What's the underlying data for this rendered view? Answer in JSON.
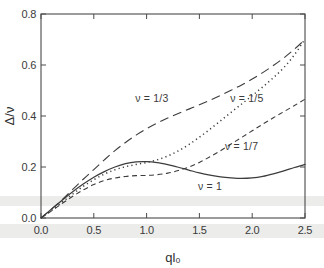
{
  "figure": {
    "background_color": "#ffffff",
    "ink_color": "#3c3c3c"
  },
  "axes": {
    "x_title": "ql₀",
    "y_title": "Δ/ν",
    "x_ticks": [
      "0.0",
      "0.5",
      "1.0",
      "1.5",
      "2.0",
      "2.5"
    ],
    "y_ticks": [
      "0.0",
      "0.2",
      "0.4",
      "0.6",
      "0.8"
    ]
  },
  "labels": {
    "nu_one_third": "ν = 1/3",
    "nu_one_fifth": "ν = 1/5",
    "nu_one_seventh": "ν = 1/7",
    "nu_one": "ν = 1"
  },
  "chart_data": {
    "type": "line",
    "title": "",
    "xlabel": "ql₀",
    "ylabel": "Δ/ν",
    "xlim": [
      0.0,
      2.5
    ],
    "ylim": [
      0.0,
      0.8
    ],
    "xticks": [
      0.0,
      0.5,
      1.0,
      1.5,
      2.0,
      2.5
    ],
    "yticks": [
      0.0,
      0.2,
      0.4,
      0.6,
      0.8
    ],
    "grid": false,
    "legend": "inline-annotations",
    "series": [
      {
        "name": "ν = 1/3",
        "style": "long-dash",
        "x": [
          0.0,
          0.1,
          0.2,
          0.3,
          0.4,
          0.5,
          0.6,
          0.7,
          0.8,
          0.9,
          1.0,
          1.1,
          1.2,
          1.3,
          1.4,
          1.5,
          1.6,
          1.7,
          1.8,
          1.9,
          2.0,
          2.1,
          2.2,
          2.3,
          2.4,
          2.5
        ],
        "y": [
          0.0,
          0.035,
          0.072,
          0.112,
          0.152,
          0.19,
          0.228,
          0.264,
          0.296,
          0.325,
          0.35,
          0.372,
          0.392,
          0.41,
          0.427,
          0.444,
          0.462,
          0.481,
          0.501,
          0.522,
          0.545,
          0.57,
          0.598,
          0.628,
          0.662,
          0.7
        ]
      },
      {
        "name": "ν = 1/5",
        "style": "dotted",
        "x": [
          0.0,
          0.1,
          0.2,
          0.3,
          0.4,
          0.5,
          0.6,
          0.7,
          0.8,
          0.9,
          1.0,
          1.1,
          1.2,
          1.3,
          1.4,
          1.5,
          1.6,
          1.7,
          1.8,
          1.9,
          2.0,
          2.1,
          2.2,
          2.3,
          2.4,
          2.5
        ],
        "y": [
          0.0,
          0.03,
          0.062,
          0.094,
          0.124,
          0.15,
          0.172,
          0.189,
          0.201,
          0.21,
          0.218,
          0.228,
          0.243,
          0.263,
          0.288,
          0.317,
          0.348,
          0.381,
          0.414,
          0.447,
          0.48,
          0.514,
          0.55,
          0.59,
          0.64,
          0.702
        ]
      },
      {
        "name": "ν = 1/7",
        "style": "short-dash",
        "x": [
          0.0,
          0.1,
          0.2,
          0.3,
          0.4,
          0.5,
          0.6,
          0.7,
          0.8,
          0.9,
          1.0,
          1.1,
          1.2,
          1.3,
          1.4,
          1.5,
          1.6,
          1.7,
          1.8,
          1.9,
          2.0,
          2.1,
          2.2,
          2.3,
          2.4,
          2.5
        ],
        "y": [
          0.0,
          0.028,
          0.057,
          0.085,
          0.11,
          0.131,
          0.147,
          0.157,
          0.163,
          0.166,
          0.167,
          0.17,
          0.176,
          0.186,
          0.2,
          0.218,
          0.24,
          0.264,
          0.29,
          0.316,
          0.342,
          0.368,
          0.393,
          0.417,
          0.441,
          0.466
        ]
      },
      {
        "name": "ν = 1",
        "style": "solid",
        "x": [
          0.0,
          0.1,
          0.2,
          0.3,
          0.4,
          0.5,
          0.6,
          0.7,
          0.8,
          0.9,
          1.0,
          1.1,
          1.2,
          1.3,
          1.4,
          1.5,
          1.6,
          1.7,
          1.8,
          1.9,
          2.0,
          2.1,
          2.2,
          2.3,
          2.4,
          2.5
        ],
        "y": [
          0.0,
          0.035,
          0.07,
          0.103,
          0.133,
          0.16,
          0.182,
          0.2,
          0.213,
          0.22,
          0.221,
          0.217,
          0.209,
          0.199,
          0.188,
          0.177,
          0.168,
          0.161,
          0.157,
          0.155,
          0.157,
          0.163,
          0.173,
          0.185,
          0.198,
          0.21
        ]
      }
    ],
    "annotations": [
      {
        "text": "ν = 1/3",
        "x": 1.05,
        "y": 0.455
      },
      {
        "text": "ν = 1/5",
        "x": 1.95,
        "y": 0.455
      },
      {
        "text": "ν = 1/7",
        "x": 1.9,
        "y": 0.268
      },
      {
        "text": "ν = 1",
        "x": 1.6,
        "y": 0.108
      }
    ]
  }
}
